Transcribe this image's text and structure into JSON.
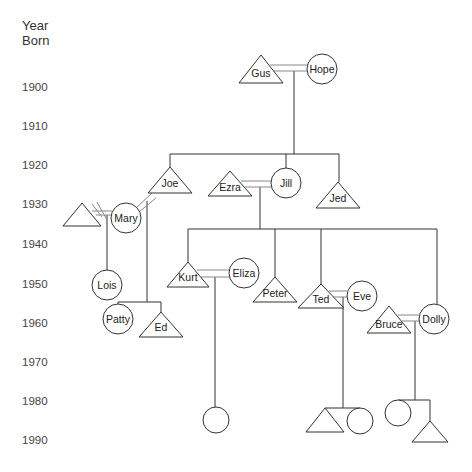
{
  "axis": {
    "title_line1": "Year",
    "title_line2": "Born",
    "years": [
      {
        "label": "1900",
        "y": 87
      },
      {
        "label": "1910",
        "y": 126
      },
      {
        "label": "1920",
        "y": 165
      },
      {
        "label": "1930",
        "y": 204
      },
      {
        "label": "1940",
        "y": 244
      },
      {
        "label": "1950",
        "y": 284
      },
      {
        "label": "1960",
        "y": 323
      },
      {
        "label": "1970",
        "y": 362
      },
      {
        "label": "1980",
        "y": 401
      },
      {
        "label": "1990",
        "y": 440
      }
    ]
  },
  "style": {
    "stroke": "#333333",
    "marriage_stroke": "#888888"
  },
  "people": [
    {
      "id": "gus",
      "name": "Gus",
      "sex": "male",
      "x": 261,
      "apex": 55,
      "base": 83,
      "half": 22,
      "label_y": 77
    },
    {
      "id": "hope",
      "name": "Hope",
      "sex": "female",
      "cx": 322,
      "cy": 69,
      "r": 15
    },
    {
      "id": "joe",
      "name": "Joe",
      "sex": "male",
      "x": 170,
      "apex": 167,
      "base": 193,
      "half": 22,
      "label_y": 187
    },
    {
      "id": "ezra",
      "name": "Ezra",
      "sex": "male",
      "x": 230,
      "apex": 171,
      "base": 196,
      "half": 22,
      "label_y": 191
    },
    {
      "id": "jill",
      "name": "Jill",
      "sex": "female",
      "cx": 286,
      "cy": 183,
      "r": 15
    },
    {
      "id": "jed",
      "name": "Jed",
      "sex": "male",
      "x": 338,
      "apex": 182,
      "base": 208,
      "half": 22,
      "label_y": 202
    },
    {
      "id": "unnamed",
      "name": "",
      "sex": "male",
      "x": 82,
      "apex": 203,
      "base": 226,
      "half": 19,
      "label_y": 222
    },
    {
      "id": "mary",
      "name": "Mary",
      "sex": "female",
      "cx": 126,
      "cy": 218,
      "r": 15
    },
    {
      "id": "lois",
      "name": "Lois",
      "sex": "female",
      "cx": 107,
      "cy": 285,
      "r": 15
    },
    {
      "id": "patty",
      "name": "Patty",
      "sex": "female",
      "cx": 118,
      "cy": 319,
      "r": 15
    },
    {
      "id": "ed",
      "name": "Ed",
      "sex": "male",
      "x": 161,
      "apex": 312,
      "base": 337,
      "half": 22,
      "label_y": 331
    },
    {
      "id": "kurt",
      "name": "Kurt",
      "sex": "male",
      "x": 188,
      "apex": 262,
      "base": 287,
      "half": 21,
      "label_y": 281
    },
    {
      "id": "eliza",
      "name": "Eliza",
      "sex": "female",
      "cx": 244,
      "cy": 273,
      "r": 15
    },
    {
      "id": "peter",
      "name": "Peter",
      "sex": "male",
      "x": 275,
      "apex": 277,
      "base": 302,
      "half": 22,
      "label_y": 297
    },
    {
      "id": "ted",
      "name": "Ted",
      "sex": "male",
      "x": 321,
      "apex": 284,
      "base": 308,
      "half": 23,
      "label_y": 303
    },
    {
      "id": "eve",
      "name": "Eve",
      "sex": "female",
      "cx": 362,
      "cy": 296,
      "r": 15
    },
    {
      "id": "bruce",
      "name": "Bruce",
      "sex": "male",
      "x": 389,
      "apex": 306,
      "base": 333,
      "half": 22,
      "label_y": 328
    },
    {
      "id": "dolly",
      "name": "Dolly",
      "sex": "female",
      "cx": 434,
      "cy": 319,
      "r": 15
    },
    {
      "id": "kurt_child",
      "name": "",
      "sex": "female",
      "cx": 216,
      "cy": 420,
      "r": 13
    },
    {
      "id": "ted_child_m",
      "name": "",
      "sex": "male",
      "x": 325,
      "apex": 408,
      "base": 432,
      "half": 19,
      "label_y": 428
    },
    {
      "id": "ted_child_f",
      "name": "",
      "sex": "female",
      "cx": 360,
      "cy": 421,
      "r": 13
    },
    {
      "id": "bruce_child_f",
      "name": "",
      "sex": "female",
      "cx": 398,
      "cy": 413,
      "r": 13
    },
    {
      "id": "bruce_child_m",
      "name": "",
      "sex": "male",
      "x": 430,
      "apex": 421,
      "base": 442,
      "half": 18,
      "label_y": 438
    }
  ],
  "marriages": [
    {
      "id": "gus-hope",
      "lines": [
        [
          270,
          65,
          308,
          65
        ],
        [
          270,
          71,
          308,
          71
        ]
      ]
    },
    {
      "id": "ezra-jill",
      "lines": [
        [
          241,
          181,
          272,
          181
        ],
        [
          245,
          187,
          272,
          187
        ]
      ]
    },
    {
      "id": "joe-mary",
      "lines": [
        [
          136,
          208,
          152,
          193
        ],
        [
          139,
          212,
          156,
          198
        ]
      ]
    },
    {
      "id": "unnamed-mary",
      "lines": [
        [
          92,
          211,
          112,
          211
        ],
        [
          96,
          215,
          112,
          215
        ]
      ],
      "divorced": true,
      "slashes": [
        [
          92,
          204,
          102,
          217
        ],
        [
          97,
          202,
          107,
          220
        ]
      ]
    },
    {
      "id": "kurt-eliza",
      "lines": [
        [
          197,
          270,
          230,
          270
        ],
        [
          201,
          277,
          230,
          277
        ]
      ]
    },
    {
      "id": "ted-eve",
      "lines": [
        [
          329,
          291,
          347,
          291
        ],
        [
          333,
          297,
          347,
          297
        ]
      ]
    },
    {
      "id": "bruce-dolly",
      "lines": [
        [
          398,
          315,
          419,
          315
        ],
        [
          402,
          321,
          419,
          321
        ]
      ]
    }
  ],
  "descent_lines": [
    [
      294,
      71,
      294,
      154
    ],
    [
      170,
      154,
      339,
      154
    ],
    [
      170,
      154,
      170,
      167
    ],
    [
      286,
      154,
      286,
      168
    ],
    [
      339,
      154,
      339,
      182
    ],
    [
      260,
      187,
      260,
      229
    ],
    [
      188,
      229,
      437,
      229
    ],
    [
      188,
      229,
      188,
      262
    ],
    [
      275,
      229,
      275,
      277
    ],
    [
      321,
      229,
      321,
      284
    ],
    [
      437,
      229,
      437,
      304
    ],
    [
      107,
      215,
      107,
      270
    ],
    [
      147,
      201,
      147,
      302
    ],
    [
      118,
      302,
      161,
      302
    ],
    [
      118,
      302,
      118,
      304
    ],
    [
      161,
      302,
      161,
      312
    ],
    [
      215,
      277,
      215,
      407
    ],
    [
      343,
      297,
      343,
      408
    ],
    [
      325,
      408,
      360,
      408
    ],
    [
      415,
      321,
      415,
      400
    ],
    [
      398,
      400,
      430,
      400
    ],
    [
      430,
      400,
      430,
      421
    ]
  ]
}
